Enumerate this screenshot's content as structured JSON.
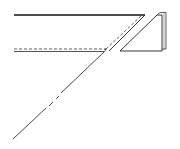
{
  "diagram": {
    "colors": {
      "stroke": "#222222",
      "light_stroke": "#555555",
      "background": "#ffffff"
    }
  }
}
